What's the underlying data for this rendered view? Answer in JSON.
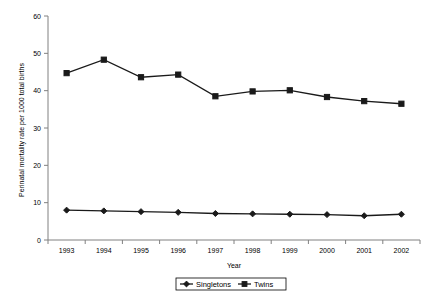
{
  "chart_data": {
    "type": "line",
    "title": "",
    "xlabel": "Year",
    "ylabel": "Perinatal mortality rate per 1000 total births",
    "categories": [
      "1993",
      "1994",
      "1995",
      "1996",
      "1997",
      "1998",
      "1999",
      "2000",
      "2001",
      "2002"
    ],
    "xlim": [
      1993,
      2002
    ],
    "ylim": [
      0,
      60
    ],
    "yticks": [
      0,
      10,
      20,
      30,
      40,
      50,
      60
    ],
    "ytick_labels": [
      "0",
      "10",
      "20",
      "30",
      "40",
      "50",
      "60"
    ],
    "grid": false,
    "legend_position": "bottom-center",
    "series": [
      {
        "name": "Singletons",
        "marker": "diamond",
        "color": "#1a1a1a",
        "values": [
          8.0,
          7.8,
          7.6,
          7.4,
          7.1,
          7.0,
          6.9,
          6.8,
          6.5,
          6.9
        ]
      },
      {
        "name": "Twins",
        "marker": "square",
        "color": "#1a1a1a",
        "values": [
          44.7,
          48.3,
          43.6,
          44.3,
          38.5,
          39.8,
          40.1,
          38.3,
          37.2,
          36.5
        ]
      }
    ]
  },
  "legend": {
    "entries": [
      "Singletons",
      "Twins"
    ]
  },
  "axes": {
    "x_title": "Year",
    "y_title": "Perinatal mortality rate per 1000 total births"
  }
}
